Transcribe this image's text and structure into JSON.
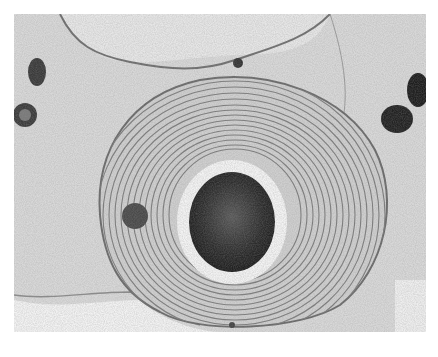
{
  "image": {
    "kind": "electron-micrograph",
    "colors": {
      "background": "#ffffff",
      "cytoplasm": "#d9d9d9",
      "lamellae": "#7a7a7a",
      "core": "#2a2a2a",
      "halo": "#f4f4f4"
    }
  }
}
